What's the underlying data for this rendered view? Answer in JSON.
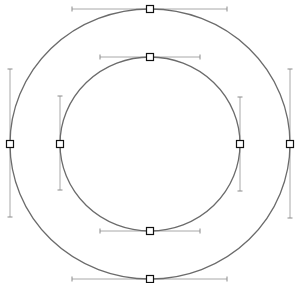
{
  "canvas": {
    "width": 297,
    "height": 283,
    "background": "#ffffff"
  },
  "colors": {
    "path": "#6b6b6b",
    "handle": "#a8a8a8",
    "anchor_stroke": "#111111",
    "anchor_fill": "#ffffff"
  },
  "paths": [
    {
      "name": "outer-ellipse",
      "cx": 150,
      "cy": 144,
      "rx": 140,
      "ry": 135,
      "anchors": [
        {
          "id": "top",
          "x": 150,
          "y": 9,
          "handle": {
            "x1": 72,
            "y1": 9,
            "x2": 227,
            "y2": 9
          }
        },
        {
          "id": "right",
          "x": 290,
          "y": 144,
          "handle": {
            "x1": 290,
            "y1": 69,
            "x2": 290,
            "y2": 218
          }
        },
        {
          "id": "bottom",
          "x": 150,
          "y": 279,
          "handle": {
            "x1": 72,
            "y1": 279,
            "x2": 227,
            "y2": 279
          }
        },
        {
          "id": "left",
          "x": 10,
          "y": 144,
          "handle": {
            "x1": 10,
            "y1": 69,
            "x2": 10,
            "y2": 217
          }
        }
      ]
    },
    {
      "name": "inner-ellipse",
      "cx": 150,
      "cy": 144,
      "rx": 90,
      "ry": 87,
      "anchors": [
        {
          "id": "top",
          "x": 150,
          "y": 57,
          "handle": {
            "x1": 100,
            "y1": 57,
            "x2": 200,
            "y2": 57
          }
        },
        {
          "id": "right",
          "x": 240,
          "y": 144,
          "handle": {
            "x1": 240,
            "y1": 97,
            "x2": 240,
            "y2": 191
          }
        },
        {
          "id": "bottom",
          "x": 150,
          "y": 231,
          "handle": {
            "x1": 100,
            "y1": 231,
            "x2": 200,
            "y2": 231
          }
        },
        {
          "id": "left",
          "x": 60,
          "y": 144,
          "handle": {
            "x1": 60,
            "y1": 96,
            "x2": 60,
            "y2": 190
          }
        }
      ]
    }
  ],
  "anchor_size": 7
}
